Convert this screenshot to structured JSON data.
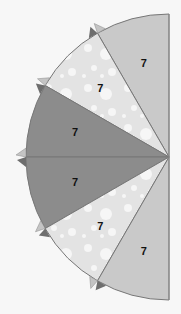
{
  "chart_data": {
    "type": "pie",
    "variant": "half-pie (left semicircle)",
    "title": "",
    "categories": [
      "Slice 1",
      "Slice 2",
      "Slice 3",
      "Slice 4",
      "Slice 5",
      "Slice 6"
    ],
    "values": [
      7,
      7,
      7,
      7,
      7,
      7
    ],
    "labels": [
      "7",
      "7",
      "7",
      "7",
      "7",
      "7"
    ],
    "colors": [
      "#c9c9c9",
      "#e3e3e3",
      "#8c8c8c",
      "#8c8c8c",
      "#e3e3e3",
      "#c9c9c9"
    ],
    "patterns": [
      "solid",
      "bubbles",
      "solid",
      "solid",
      "bubbles",
      "solid"
    ],
    "start_angle_deg": 0,
    "span_deg": 180,
    "legend": "none",
    "grid": false
  }
}
